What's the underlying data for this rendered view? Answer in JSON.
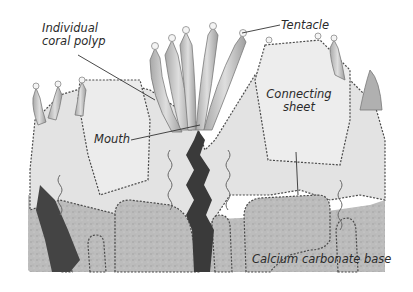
{
  "diagram": {
    "labels": {
      "individual_polyp_line1": "Individual",
      "individual_polyp_line2": "coral polyp",
      "tentacle": "Tentacle",
      "connecting_sheet_line1": "Connecting",
      "connecting_sheet_line2": "sheet",
      "mouth": "Mouth",
      "base": "Calcium carbonate base"
    },
    "colors": {
      "background": "#ffffff",
      "tissue": "#e2e2e2",
      "tentacle": "#c4c4c4",
      "base": "#bdbdbd",
      "gut": "#3a3a3a",
      "outline": "#4a4a4a",
      "leader_line": "#333333"
    }
  }
}
